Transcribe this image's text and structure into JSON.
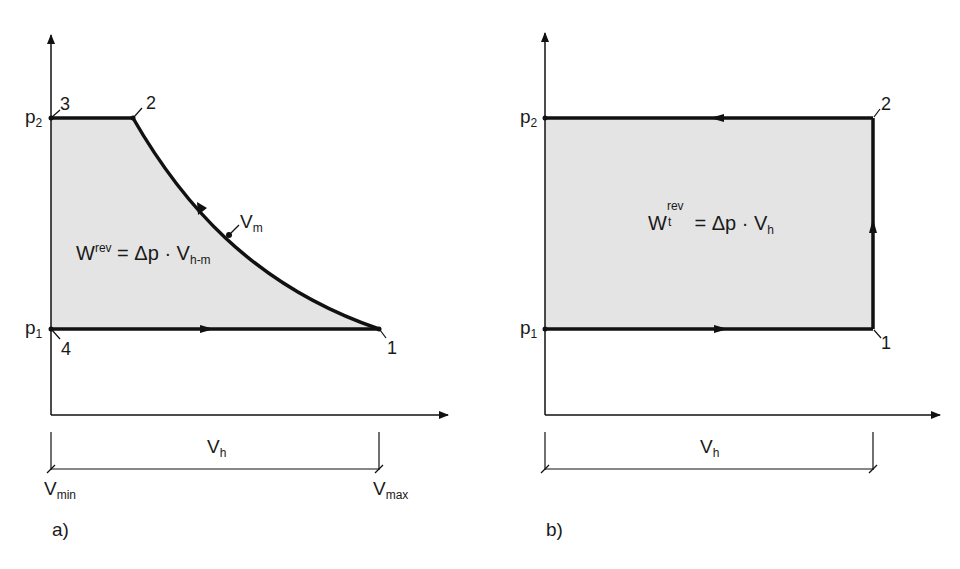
{
  "diagram_a": {
    "caption": "a)",
    "axis_labels": {
      "p2": "p",
      "p2_sub": "2",
      "p1": "p",
      "p1_sub": "1"
    },
    "points": {
      "p1": "1",
      "p2": "2",
      "p3": "3",
      "p4": "4",
      "vm": "V",
      "vm_sub": "m"
    },
    "formula": {
      "w": "W",
      "w_sup": "rev",
      "rest": " = Δp · V",
      "rest_sub": "h-m"
    },
    "dimension": {
      "vh": "V",
      "vh_sub": "h",
      "vmin": "V",
      "vmin_sub": "min",
      "vmax": "V",
      "vmax_sub": "max"
    }
  },
  "diagram_b": {
    "caption": "b)",
    "axis_labels": {
      "p2": "p",
      "p2_sub": "2",
      "p1": "p",
      "p1_sub": "1"
    },
    "points": {
      "p1": "1",
      "p2": "2"
    },
    "formula": {
      "w": "W",
      "w_sup": "rev",
      "w_sub": "t",
      "rest": " = Δp · V",
      "rest_sub": "h"
    },
    "dimension": {
      "vh": "V",
      "vh_sub": "h"
    }
  },
  "colors": {
    "fill": "#e4e4e4",
    "line": "#111111"
  }
}
